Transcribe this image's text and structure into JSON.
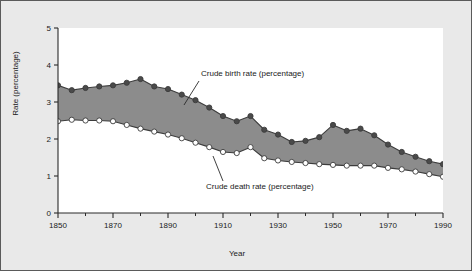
{
  "chart_data": {
    "type": "area",
    "title": "",
    "xlabel": "Year",
    "ylabel": "Rate (percentage)",
    "xlim": [
      1850,
      1990
    ],
    "ylim": [
      0,
      5
    ],
    "xticks": [
      1850,
      1870,
      1890,
      1910,
      1930,
      1950,
      1970,
      1990
    ],
    "xticks_minor": [
      1860,
      1880,
      1900,
      1920,
      1940,
      1960,
      1980
    ],
    "yticks": [
      0,
      1,
      2,
      3,
      4,
      5
    ],
    "grid": false,
    "legend": "annotations",
    "fill_between": true,
    "fill_color": "#8c8c8c",
    "annotations": [
      {
        "text": "Crude birth rate (percentage)",
        "series": "Crude birth rate (percentage)",
        "text_x": 200,
        "text_y": 75,
        "leader_from_x": 198,
        "leader_from_y": 80,
        "leader_to_x": 183,
        "leader_to_y": 104
      },
      {
        "text": "Crude death rate (percentage)",
        "series": "Crude death rate (percentage)",
        "text_x": 205,
        "text_y": 188,
        "leader_from_x": 222,
        "leader_from_y": 180,
        "leader_to_x": 212,
        "leader_to_y": 155
      }
    ],
    "x": [
      1850,
      1855,
      1860,
      1865,
      1870,
      1875,
      1880,
      1885,
      1890,
      1895,
      1900,
      1905,
      1910,
      1915,
      1920,
      1925,
      1930,
      1935,
      1940,
      1945,
      1950,
      1955,
      1960,
      1965,
      1970,
      1975,
      1980,
      1985,
      1990
    ],
    "series": [
      {
        "name": "Crude birth rate (percentage)",
        "marker": "filled-circle",
        "marker_color": "#4a4a4a",
        "line_color": "#3c3c3c",
        "values": [
          3.45,
          3.32,
          3.38,
          3.42,
          3.45,
          3.52,
          3.62,
          3.42,
          3.35,
          3.2,
          3.05,
          2.85,
          2.62,
          2.48,
          2.62,
          2.25,
          2.12,
          1.92,
          1.95,
          2.05,
          2.38,
          2.22,
          2.28,
          2.1,
          1.85,
          1.65,
          1.52,
          1.4,
          1.32
        ]
      },
      {
        "name": "Crude death rate (percentage)",
        "marker": "open-circle",
        "marker_color": "#ffffff",
        "line_color": "#3c3c3c",
        "values": [
          2.48,
          2.52,
          2.5,
          2.5,
          2.48,
          2.38,
          2.28,
          2.2,
          2.12,
          2.02,
          1.9,
          1.78,
          1.65,
          1.62,
          1.78,
          1.48,
          1.42,
          1.38,
          1.35,
          1.32,
          1.3,
          1.28,
          1.28,
          1.28,
          1.22,
          1.18,
          1.12,
          1.05,
          0.98
        ]
      }
    ]
  }
}
